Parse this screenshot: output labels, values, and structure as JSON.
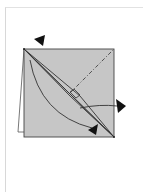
{
  "diagram": {
    "type": "origami-fold-step",
    "paper_color": "#c4c4c4",
    "line_color": "#3a3a3a",
    "arrow_color": "#111111",
    "icons": {
      "top_arrow": "fold-direction-arrow-icon",
      "right_arrow": "pull-out-arrow-icon",
      "bottom_arrow": "fold-arc-arrow-icon"
    },
    "lines": {
      "diagonal": "fold-line",
      "dash_dot": "mountain-fold-line"
    }
  }
}
